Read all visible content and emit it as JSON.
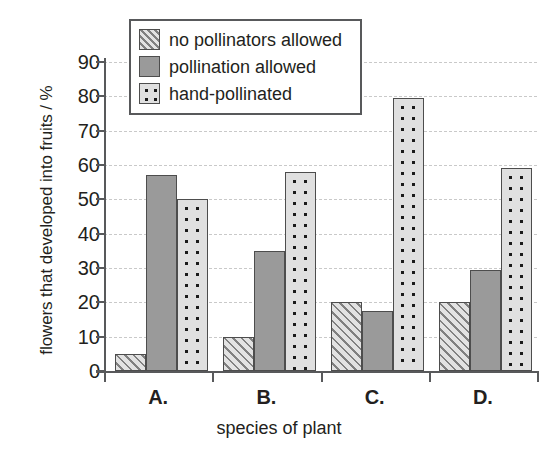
{
  "chart_data": {
    "type": "bar",
    "title": "",
    "xlabel": "species of plant",
    "ylabel": "flowers that developed into fruits / %",
    "categories": [
      "A.",
      "B.",
      "C.",
      "D."
    ],
    "series": [
      {
        "name": "no pollinators allowed",
        "pattern": "hatched",
        "values": [
          5,
          10,
          20,
          20
        ]
      },
      {
        "name": "pollination allowed",
        "pattern": "solid",
        "values": [
          57,
          35,
          17.5,
          29.5
        ]
      },
      {
        "name": "hand-pollinated",
        "pattern": "dotted",
        "values": [
          50,
          58,
          79.5,
          59
        ]
      }
    ],
    "ylim": [
      0,
      90
    ],
    "yticks": [
      0,
      10,
      20,
      30,
      40,
      50,
      60,
      70,
      80,
      90
    ],
    "ytick_labels": [
      "0",
      "10",
      "20",
      "30",
      "40",
      "50",
      "60",
      "70",
      "80",
      "90"
    ],
    "grid": true,
    "legend_position": "upper left",
    "colors": {
      "solid_fill": "#9a9a9a",
      "hatch_fill": "#e2e2e2",
      "dot_fill": "#e0e0e0",
      "bar_outline": "#4d4d4d",
      "axis": "#58595b",
      "gridline": "#c9c9c9",
      "text": "#231f20",
      "background": "#ffffff"
    }
  },
  "legend": {
    "items": [
      {
        "label": "no pollinators allowed"
      },
      {
        "label": "pollination allowed"
      },
      {
        "label": "hand-pollinated"
      }
    ]
  },
  "axes": {
    "y_title": "flowers that developed into fruits / %",
    "x_title": "species of plant"
  }
}
